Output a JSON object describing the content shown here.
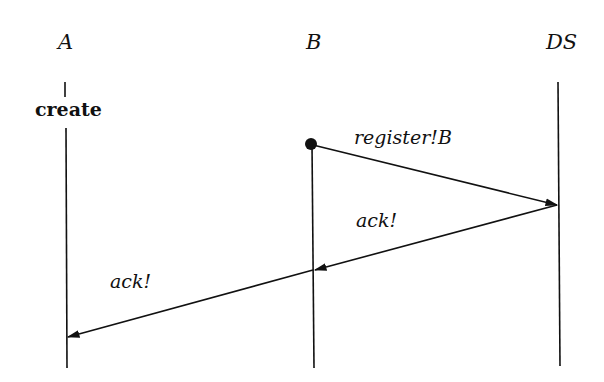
{
  "diagram": {
    "type": "message-sequence-chart",
    "instances": [
      {
        "id": "A",
        "label": "A"
      },
      {
        "id": "B",
        "label": "B"
      },
      {
        "id": "DS",
        "label": "DS"
      }
    ],
    "actions": [
      {
        "instance": "A",
        "label": "create"
      }
    ],
    "messages": [
      {
        "from": "B",
        "to": "DS",
        "label": "register!B",
        "start_marker": "filled-dot"
      },
      {
        "from": "DS",
        "to": "B",
        "label": "ack!"
      },
      {
        "from": "B",
        "to": "A",
        "label": "ack!"
      }
    ],
    "colors": {
      "line": "#111111",
      "background": "#ffffff"
    }
  }
}
